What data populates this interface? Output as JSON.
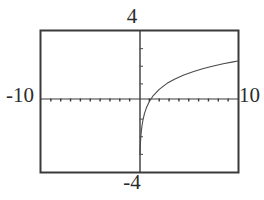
{
  "screen": {
    "title": "graphing-calculator-plot",
    "background_color": "#ffffff",
    "frame_color": "#3a3a3a",
    "curve_color": "#4a4a4a",
    "axis_color": "#3a3a3a"
  },
  "labels": {
    "y_max": "4",
    "y_min": "-4",
    "x_min": "-10",
    "x_max": "10"
  },
  "chart_data": {
    "type": "line",
    "title": "",
    "subtitle": "",
    "xlabel": "",
    "ylabel": "",
    "xlim": [
      -10,
      10
    ],
    "ylim": [
      -4,
      4
    ],
    "grid": false,
    "legend": null,
    "axis_ticks": {
      "x_tick_step": 1,
      "y_tick_step": 1,
      "x_ticks": [
        -10,
        -9,
        -8,
        -7,
        -6,
        -5,
        -4,
        -3,
        -2,
        -1,
        0,
        1,
        2,
        3,
        4,
        5,
        6,
        7,
        8,
        9,
        10
      ],
      "y_ticks": [
        -4,
        -3,
        -2,
        -1,
        0,
        1,
        2,
        3,
        4
      ],
      "tick_style": "short-marks-on-axis"
    },
    "annotations": [
      "vertical asymptote at x = 0",
      "curve only defined for x > 0",
      "x-intercept near x = 1"
    ],
    "series": [
      {
        "name": "y = ln(x)",
        "x": [
          0.05,
          0.08,
          0.12,
          0.18,
          0.25,
          0.35,
          0.5,
          0.7,
          1.0,
          1.4,
          2.0,
          2.8,
          3.6,
          4.5,
          5.5,
          6.5,
          7.5,
          8.5,
          9.5,
          10.0
        ],
        "values": [
          -3.0,
          -2.53,
          -2.12,
          -1.71,
          -1.39,
          -1.05,
          -0.69,
          -0.36,
          0.0,
          0.34,
          0.69,
          1.03,
          1.28,
          1.5,
          1.7,
          1.87,
          2.01,
          2.14,
          2.25,
          2.3
        ]
      }
    ]
  }
}
